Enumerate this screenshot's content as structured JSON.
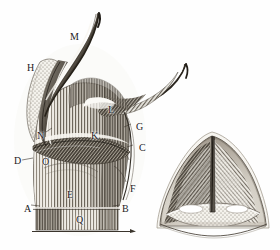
{
  "figure": {
    "background_color": "#fefefe",
    "ink_color": "#3a3630",
    "shading_color": "#6e675d",
    "highlight_color": "#f5f2ec"
  },
  "left_figure": {
    "name": "lateral-view",
    "labels": [
      {
        "text": "M",
        "x": 70,
        "y": 32
      },
      {
        "text": "H",
        "x": 27,
        "y": 63
      },
      {
        "text": "L",
        "x": 108,
        "y": 105
      },
      {
        "text": "G",
        "x": 136,
        "y": 122
      },
      {
        "text": "N",
        "x": 37,
        "y": 131
      },
      {
        "text": "K",
        "x": 91,
        "y": 131
      },
      {
        "text": "C",
        "x": 139,
        "y": 143
      },
      {
        "text": "D",
        "x": 14,
        "y": 156
      },
      {
        "text": "O",
        "x": 42,
        "y": 157
      },
      {
        "text": "E",
        "x": 67,
        "y": 190
      },
      {
        "text": "F",
        "x": 130,
        "y": 184
      },
      {
        "text": "A",
        "x": 24,
        "y": 204
      },
      {
        "text": "B",
        "x": 122,
        "y": 204
      },
      {
        "text": "Q",
        "x": 76,
        "y": 215
      }
    ]
  },
  "right_figure": {
    "name": "anterior-cross-section-view",
    "labels": []
  }
}
